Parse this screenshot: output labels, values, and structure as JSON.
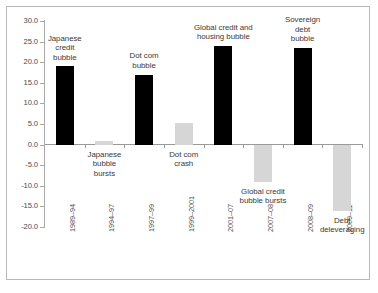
{
  "chart_data": {
    "type": "bar",
    "title": "",
    "subtitle": "",
    "xlabel": "",
    "ylabel": "",
    "ylim": [
      -20.0,
      30.0
    ],
    "ytick_step": 5.0,
    "yticks": [
      "30.0",
      "25.0",
      "20.0",
      "15.0",
      "10.0",
      "5.0",
      "0.0",
      "-5.0",
      "-10.0",
      "-15.0",
      "-20.0"
    ],
    "ytick_values": [
      30.0,
      25.0,
      20.0,
      15.0,
      10.0,
      5.0,
      0.0,
      -5.0,
      -10.0,
      -15.0,
      -20.0
    ],
    "grid": false,
    "legend": "none",
    "categories": [
      "1989–94",
      "1994–97",
      "1997–99",
      "1999–2001",
      "2001–07",
      "2007–08",
      "2008–09",
      "2009–11"
    ],
    "values": [
      19.0,
      0.8,
      17.0,
      5.2,
      24.0,
      -9.0,
      23.5,
      -16.0
    ],
    "bar_colors": [
      "#000000",
      "#d6d6d6",
      "#000000",
      "#d6d6d6",
      "#000000",
      "#d6d6d6",
      "#000000",
      "#d6d6d6"
    ],
    "series": [
      {
        "name": "Credit cycle phases",
        "values": [
          19.0,
          0.8,
          17.0,
          5.2,
          24.0,
          -9.0,
          23.5,
          -16.0
        ]
      }
    ],
    "annotations": [
      {
        "index": 0,
        "text": "Japanese\ncredit\nbubble",
        "position": "above"
      },
      {
        "index": 1,
        "text": "Japanese\nbubble\nbursts",
        "position": "below"
      },
      {
        "index": 2,
        "text": "Dot com\nbubble",
        "position": "above"
      },
      {
        "index": 3,
        "text": "Dot com\ncrash",
        "position": "below"
      },
      {
        "index": 4,
        "text": "Global credit and\nhousing bubble",
        "position": "above"
      },
      {
        "index": 5,
        "text": "Global credit\nbubble bursts",
        "position": "below"
      },
      {
        "index": 6,
        "text": "Sovereign\ndebt\nbubble",
        "position": "above"
      },
      {
        "index": 7,
        "text": "Debt\ndeleveraging",
        "position": "below"
      }
    ]
  },
  "colors": {
    "bar_positive": "#000000",
    "bar_negative": "#d6d6d6",
    "axis": "#9a9a9a",
    "tick_text": "#4a4a4a",
    "annotation_text": "#3a3a3a",
    "frame": "#b9b9b9",
    "background": "#ffffff"
  },
  "annotations": {
    "a0": "Japanese\ncredit\nbubble",
    "a1": "Japanese\nbubble\nbursts",
    "a2": "Dot com\nbubble",
    "a3": "Dot com\ncrash",
    "a4": "Global credit and\nhousing bubble",
    "a5": "Global credit\nbubble bursts",
    "a6": "Sovereign\ndebt\nbubble",
    "a7": "Debt\ndeleveraging"
  }
}
